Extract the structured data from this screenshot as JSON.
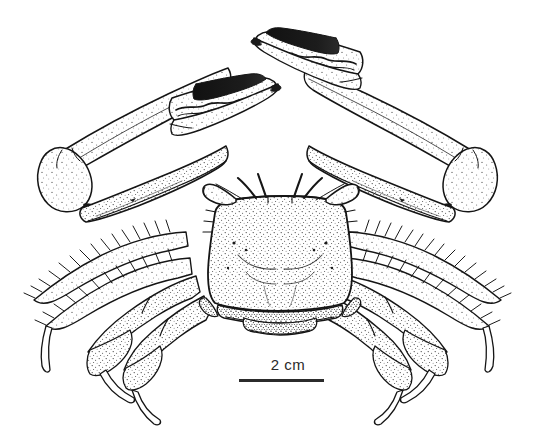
{
  "figure": {
    "kind": "scientific-line-illustration",
    "view": "dorsal",
    "background_color": "#ffffff",
    "ink_color": "#1a1a1a",
    "stipple_color": "#3a3a3a"
  },
  "scale_bar": {
    "label": "2 cm",
    "bar_color": "#2b2b2b",
    "text_color": "#2a2a2a",
    "length_px": 85
  },
  "anatomy": {
    "carapace": {
      "name": "carapace",
      "shape": "broad trapezoidal with rounded anterolateral corners",
      "shading": "stippled"
    },
    "eyes": {
      "name": "stalked-eyes",
      "count": 2,
      "description": "short eyestalks angled outward from orbital notches"
    },
    "antennae": {
      "name": "antennae",
      "count": 4,
      "description": "thin curved filaments arising between the eyestalks"
    },
    "chelipeds": {
      "name": "chelipeds",
      "count": 2,
      "description": "large claws raised above the body, merus elongate, carpus rounded, chela with dark pigmented fingers and wavy toothed occlusal margins"
    },
    "walking_legs": {
      "name": "walking-legs",
      "pairs": 4,
      "description": "pereiopods bearing dense marginal setae on merus and carpus, ending in curved pointed dactyls"
    },
    "sternum": {
      "name": "sternum-abdomen",
      "description": "ventral sternal plates visible beneath the posterior carapace margin"
    }
  }
}
